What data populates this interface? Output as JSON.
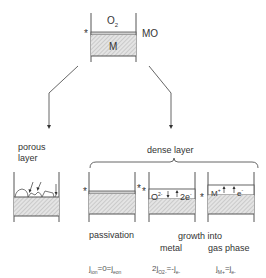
{
  "top": {
    "gas_label": "O",
    "gas_sub": "2",
    "oxide_label": "MO",
    "metal_label": "M",
    "interface_marker": "*"
  },
  "porous": {
    "label_line1": "porous",
    "label_line2": "layer"
  },
  "dense": {
    "label": "dense layer",
    "cases": [
      {
        "name": "passivation",
        "caption1": "passivation",
        "caption2": "",
        "equation": "j_ion = 0 = j_eon"
      },
      {
        "name": "growth-into-metal",
        "caption1": "growth into",
        "caption2": "metal",
        "ion": "O",
        "ion_sup": "2-",
        "electron": "2e",
        "electron_sup": "-",
        "equation": "2j_O2- = -j_e-"
      },
      {
        "name": "growth-into-gas-phase",
        "caption1": "",
        "caption2": "gas phase",
        "ion": "M",
        "ion_sup": "+",
        "electron": "e",
        "electron_sup": "-",
        "equation": "j_M+ = j_e-"
      }
    ]
  },
  "equations": {
    "passivation": {
      "a": "j",
      "a_sub": "ion",
      "mid": "=0=",
      "b": "j",
      "b_sub": "eon"
    },
    "metal": {
      "pre": "2j",
      "a_sub": "O2-",
      "mid": "=-j",
      "b_sub": "e-"
    },
    "gas": {
      "a": "j",
      "a_sub": "M+",
      "mid": "=j",
      "b_sub": "e-"
    }
  },
  "colors": {
    "line": "#555555",
    "hatch": "#bbbbbb"
  }
}
